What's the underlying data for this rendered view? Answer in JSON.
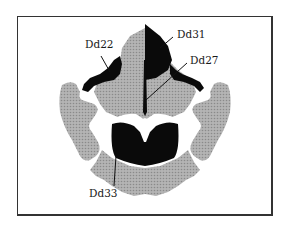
{
  "figure": {
    "type": "inkblot-location-diagram",
    "labels": [
      {
        "id": "Dd22",
        "text": "Dd22",
        "x": 85,
        "y": 48
      },
      {
        "id": "Dd31",
        "text": "Dd31",
        "x": 177,
        "y": 38
      },
      {
        "id": "Dd27",
        "text": "Dd27",
        "x": 190,
        "y": 64
      },
      {
        "id": "Dd33",
        "text": "Dd33",
        "x": 89,
        "y": 197
      }
    ],
    "colors": {
      "frame": "#333333",
      "gray_region": "#a8a8a8",
      "black_region": "#0a0a0a",
      "background": "#ffffff"
    }
  }
}
